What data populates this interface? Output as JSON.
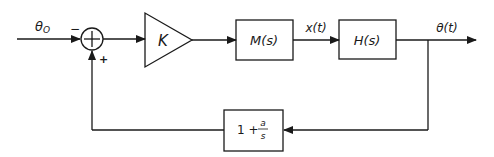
{
  "diagram": {
    "type": "feedback-control-block-diagram",
    "input_signal": {
      "label": "θ",
      "subscript": "O"
    },
    "summing_junction": {
      "symbol": "+",
      "input_sign": "−",
      "feedback_sign": "+"
    },
    "gain_block": {
      "label": "K"
    },
    "blocks": [
      {
        "id": "m",
        "label": "M(s)"
      },
      {
        "id": "h",
        "label": "H(s)"
      }
    ],
    "intermediate_signal": {
      "label": "x(t)"
    },
    "output_signal": {
      "label": "θ(t)"
    },
    "feedback_block": {
      "prefix": "1 +",
      "numerator": "a",
      "denominator": "s"
    }
  }
}
